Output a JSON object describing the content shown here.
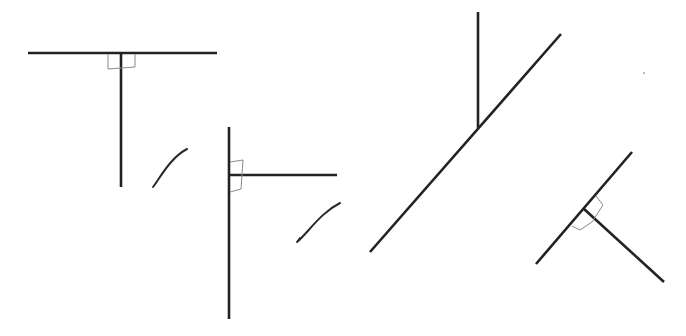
{
  "diagram": {
    "description": "Four pairs of line segments meeting at a point; three have right-angle marks, two marked with check marks",
    "colors": {
      "line": "#222222",
      "right_angle_mark": "#8a8a8a",
      "check": "#2a2a2a",
      "background": "#ffffff"
    },
    "figures": [
      {
        "id": "figure-1",
        "label": "T-shape perpendicular",
        "right_angle_marked": true,
        "checked": true,
        "lines": [
          {
            "x1": 28,
            "y1": 53,
            "x2": 217,
            "y2": 53
          },
          {
            "x1": 121,
            "y1": 53,
            "x2": 121,
            "y2": 187
          }
        ],
        "right_angle_mark": "M108,54 L108,69 L135,67 L135,54",
        "check_mark": "M156,183 L153,187 C160,178 170,158 187,149"
      },
      {
        "id": "figure-2",
        "label": "Sideways T perpendicular",
        "right_angle_marked": true,
        "checked": true,
        "lines": [
          {
            "x1": 229,
            "y1": 127,
            "x2": 229,
            "y2": 319
          },
          {
            "x1": 229,
            "y1": 175,
            "x2": 337,
            "y2": 175
          }
        ],
        "right_angle_mark": "M230,162 L243,160 L241,189 L230,192",
        "check_mark": "M300,238 L297,242 C308,233 320,213 340,203"
      },
      {
        "id": "figure-3",
        "label": "Vertical meeting diagonal (not perpendicular)",
        "right_angle_marked": false,
        "checked": false,
        "lines": [
          {
            "x1": 370,
            "y1": 252,
            "x2": 561,
            "y2": 34
          },
          {
            "x1": 478,
            "y1": 12,
            "x2": 478,
            "y2": 128
          }
        ]
      },
      {
        "id": "figure-4",
        "label": "Diagonal perpendicular",
        "right_angle_marked": true,
        "checked": false,
        "lines": [
          {
            "x1": 536,
            "y1": 264,
            "x2": 632,
            "y2": 152
          },
          {
            "x1": 584,
            "y1": 209,
            "x2": 664,
            "y2": 282
          }
        ],
        "right_angle_mark": "M572,226 L580,230 L592,222 M596,196 L603,205 L592,222"
      }
    ],
    "specks": [
      {
        "x": 644,
        "y": 73
      }
    ]
  }
}
